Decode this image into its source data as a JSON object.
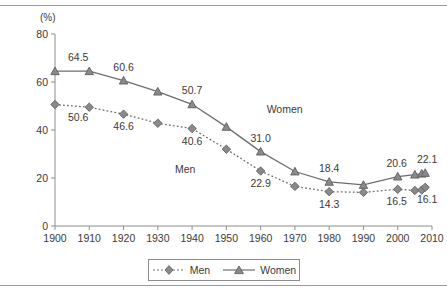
{
  "chart_data": {
    "type": "line",
    "title": "",
    "xlabel": "",
    "ylabel": "(%)",
    "unit_label": "(%)",
    "xlim": [
      1900,
      2010
    ],
    "ylim": [
      0,
      80
    ],
    "grid": false,
    "legend_position": "bottom",
    "x_ticks": [
      "1900",
      "1910",
      "1920",
      "1930",
      "1940",
      "1950",
      "1960",
      "1970",
      "1980",
      "1990",
      "2000",
      "2010"
    ],
    "y_ticks": [
      "0",
      "20",
      "40",
      "60",
      "80"
    ],
    "x": [
      1900,
      1910,
      1920,
      1930,
      1940,
      1950,
      1960,
      1970,
      1980,
      1990,
      2000,
      2005,
      2007,
      2008
    ],
    "series": [
      {
        "name": "Men",
        "marker": "diamond",
        "line_style": "dotted",
        "color": "#6e6e6e",
        "values": [
          50.6,
          49.5,
          46.6,
          42.8,
          40.6,
          32.0,
          22.9,
          16.5,
          14.3,
          14.0,
          15.3,
          14.8,
          15.0,
          16.1
        ]
      },
      {
        "name": "Women",
        "marker": "triangle",
        "line_style": "solid",
        "color": "#6e6e6e",
        "values": [
          64.5,
          64.5,
          60.6,
          56.0,
          50.7,
          41.3,
          31.0,
          22.7,
          18.4,
          17.1,
          20.6,
          21.4,
          21.8,
          22.1
        ]
      }
    ],
    "point_labels": [
      {
        "series": "Women",
        "x": 1900,
        "value": "64.5"
      },
      {
        "series": "Women",
        "x": 1920,
        "value": "60.6"
      },
      {
        "series": "Women",
        "x": 1940,
        "value": "50.7"
      },
      {
        "series": "Women",
        "x": 1960,
        "value": "31.0"
      },
      {
        "series": "Women",
        "x": 1980,
        "value": "18.4"
      },
      {
        "series": "Women",
        "x": 2000,
        "value": "20.6"
      },
      {
        "series": "Women",
        "x": 2008,
        "value": "22.1"
      },
      {
        "series": "Men",
        "x": 1900,
        "value": "50.6"
      },
      {
        "series": "Men",
        "x": 1920,
        "value": "46.6"
      },
      {
        "series": "Men",
        "x": 1940,
        "value": "40.6"
      },
      {
        "series": "Men",
        "x": 1960,
        "value": "22.9"
      },
      {
        "series": "Men",
        "x": 1980,
        "value": "14.3"
      },
      {
        "series": "Men",
        "x": 2000,
        "value": "16.5"
      },
      {
        "series": "Men",
        "x": 2008,
        "value": "16.1"
      }
    ],
    "inline_annotations": [
      {
        "text": "Women",
        "x": 1967,
        "y": 47
      },
      {
        "text": "Men",
        "x": 1938,
        "y": 22
      }
    ]
  },
  "legend": {
    "entries": [
      {
        "label": "Men"
      },
      {
        "label": "Women"
      }
    ]
  }
}
